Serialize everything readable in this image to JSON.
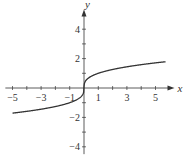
{
  "chart_data": {
    "type": "line",
    "title": "",
    "xlabel": "x",
    "ylabel": "y",
    "xlim": [
      -5.5,
      5.7
    ],
    "ylim": [
      -4.5,
      4.8
    ],
    "x_ticks": [
      -5,
      -4,
      -3,
      -2,
      -1,
      1,
      2,
      3,
      4,
      5
    ],
    "x_tick_labels": [
      "-5",
      "-3",
      "-1",
      "1",
      "3",
      "5"
    ],
    "x_tick_label_values": [
      -5,
      -3,
      -1,
      1,
      3,
      5
    ],
    "y_ticks": [
      -4,
      -3,
      -2,
      -1,
      1,
      2,
      3,
      4
    ],
    "y_tick_labels": [
      "4",
      "2",
      "-2",
      "-4"
    ],
    "y_tick_label_values": [
      4,
      2,
      -2,
      -4
    ],
    "grid": false,
    "series": [
      {
        "name": "y = cube root of x",
        "function": "cbrt",
        "x": [
          -5,
          -4,
          -3,
          -2,
          -1,
          -0.5,
          -0.1,
          0,
          0.1,
          0.5,
          1,
          2,
          3,
          4,
          5,
          5.7
        ],
        "y": [
          -1.71,
          -1.59,
          -1.44,
          -1.26,
          -1,
          -0.79,
          -0.46,
          0,
          0.46,
          0.79,
          1,
          1.26,
          1.44,
          1.59,
          1.71,
          1.79
        ]
      }
    ],
    "colors": {
      "curve": "#333333",
      "axes": "#333333"
    }
  }
}
